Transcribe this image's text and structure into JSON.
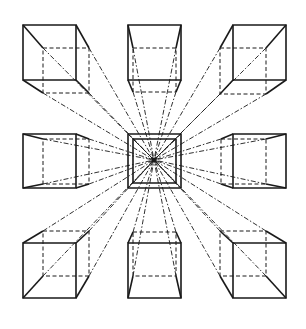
{
  "diagram": {
    "vanishing_point": [
      154,
      160
    ],
    "stroke_color": "#1a1a1a",
    "background": "#ffffff",
    "center_box": {
      "outer": [
        128,
        134,
        181,
        188
      ],
      "inner": [
        133,
        139,
        176,
        183
      ]
    },
    "cubes": [
      {
        "name": "top-left",
        "front": [
          23,
          25,
          76,
          80
        ],
        "back": [
          43,
          48,
          89,
          93
        ]
      },
      {
        "name": "top-center",
        "front": [
          128,
          25,
          181,
          80
        ],
        "back": [
          133,
          48,
          176,
          92
        ]
      },
      {
        "name": "top-right",
        "front": [
          233,
          25,
          286,
          80
        ],
        "back": [
          220,
          48,
          266,
          94
        ]
      },
      {
        "name": "middle-left",
        "front": [
          23,
          134,
          76,
          188
        ],
        "back": [
          43,
          139,
          89,
          184
        ]
      },
      {
        "name": "middle-right",
        "front": [
          233,
          134,
          286,
          188
        ],
        "back": [
          221,
          139,
          266,
          184
        ]
      },
      {
        "name": "bottom-left",
        "front": [
          23,
          243,
          76,
          298
        ],
        "back": [
          43,
          231,
          89,
          276
        ]
      },
      {
        "name": "bottom-center",
        "front": [
          128,
          243,
          181,
          298
        ],
        "back": [
          133,
          232,
          176,
          276
        ]
      },
      {
        "name": "bottom-right",
        "front": [
          233,
          243,
          286,
          298
        ],
        "back": [
          220,
          231,
          266,
          276
        ]
      }
    ]
  }
}
